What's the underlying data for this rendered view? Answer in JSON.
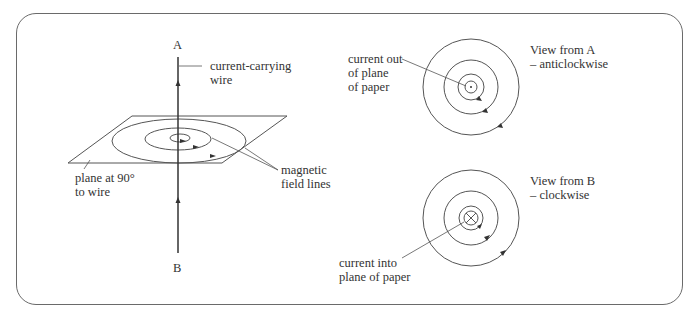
{
  "left_panel": {
    "point_a": "A",
    "point_b": "B",
    "wire_label_line1": "current-carrying",
    "wire_label_line2": "wire",
    "plane_label_line1": "plane at 90°",
    "plane_label_line2": "to wire",
    "field_label_line1": "magnetic",
    "field_label_line2": "field lines"
  },
  "top_view": {
    "caption_line1": "View from A",
    "caption_line2": "– anticlockwise",
    "pointer_line1": "current out",
    "pointer_line2": "of plane",
    "pointer_line3": "of paper",
    "direction": "anticlockwise",
    "center_symbol": "dot"
  },
  "bottom_view": {
    "caption_line1": "View from B",
    "caption_line2": "– clockwise",
    "pointer_line1": "current into",
    "pointer_line2": "plane of paper",
    "direction": "clockwise",
    "center_symbol": "cross"
  },
  "colors": {
    "line": "#555555",
    "wire": "#333333",
    "text": "#333333",
    "border": "#6a6a6a"
  }
}
